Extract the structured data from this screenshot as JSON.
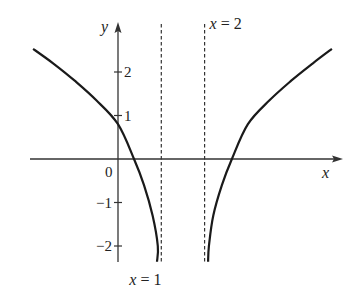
{
  "chart_data": {
    "type": "line",
    "title": "",
    "xlabel": "x",
    "ylabel": "y",
    "origin_label": "0",
    "y_ticks": [
      {
        "value": 2,
        "label": "2"
      },
      {
        "value": 1,
        "label": "1"
      },
      {
        "value": -1,
        "label": "−1"
      },
      {
        "value": -2,
        "label": "−2"
      }
    ],
    "asymptotes": [
      {
        "x": 1,
        "label": "x = 1",
        "style": "dashed",
        "label_position": "bottom"
      },
      {
        "x": 2,
        "label": "x = 2",
        "style": "dashed",
        "label_position": "top"
      }
    ],
    "xlim": [
      -2.0,
      5.2
    ],
    "ylim": [
      -2.4,
      2.8
    ],
    "grid": false,
    "legend": null,
    "series": [
      {
        "name": "left branch",
        "points": [
          [
            -1.96,
            2.53
          ],
          [
            -1.5,
            2.2
          ],
          [
            -1.0,
            1.8
          ],
          [
            -0.5,
            1.35
          ],
          [
            0.0,
            0.8
          ],
          [
            0.37,
            0.0
          ],
          [
            0.6,
            -0.6
          ],
          [
            0.8,
            -1.3
          ],
          [
            0.92,
            -2.0
          ],
          [
            0.9,
            -2.36
          ]
        ]
      },
      {
        "name": "right branch",
        "points": [
          [
            2.08,
            -2.36
          ],
          [
            2.1,
            -2.0
          ],
          [
            2.2,
            -1.3
          ],
          [
            2.4,
            -0.6
          ],
          [
            2.63,
            0.0
          ],
          [
            3.0,
            0.8
          ],
          [
            3.5,
            1.35
          ],
          [
            4.0,
            1.8
          ],
          [
            4.5,
            2.2
          ],
          [
            4.94,
            2.53
          ]
        ]
      }
    ],
    "annotations": [
      "x = 1",
      "x = 2"
    ]
  },
  "style": {
    "axis_color": "#333333",
    "curve_color": "#1a1a1a",
    "asymptote_color": "#333333"
  }
}
